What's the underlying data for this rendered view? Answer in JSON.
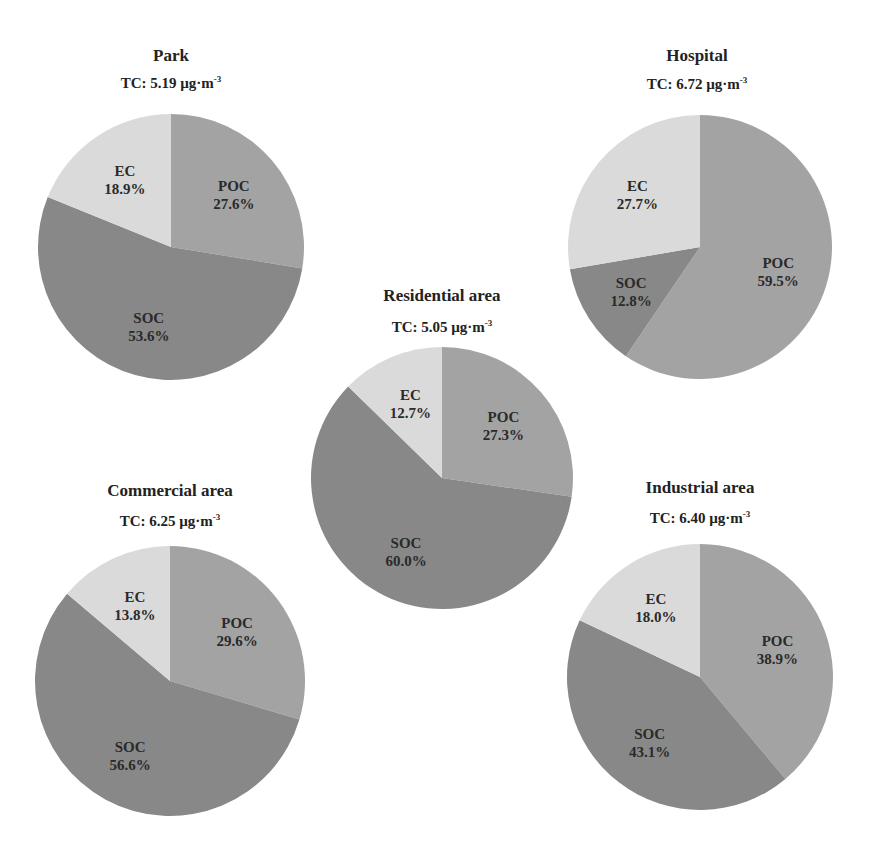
{
  "colors": {
    "POC": "#a3a3a3",
    "SOC": "#888888",
    "EC": "#dadada"
  },
  "chart_data": [
    {
      "type": "pie",
      "title": "Park",
      "subtitle": "TC: 5.19 µg·m-3",
      "tc_value": "TC: 5.19 µg·m",
      "tc_unit_exp": "-3",
      "categories": [
        "POC",
        "SOC",
        "EC"
      ],
      "values": [
        27.6,
        53.6,
        18.9
      ],
      "labels": [
        "27.6%",
        "53.6%",
        "18.9%"
      ],
      "center": [
        171,
        247
      ],
      "radius": 133,
      "title_pos": [
        171,
        46
      ],
      "tc_pos": [
        171,
        74
      ]
    },
    {
      "type": "pie",
      "title": "Hospital",
      "subtitle": "TC: 6.72 µg·m-3",
      "tc_value": "TC: 6.72 µg·m",
      "tc_unit_exp": "-3",
      "categories": [
        "POC",
        "SOC",
        "EC"
      ],
      "values": [
        59.5,
        12.8,
        27.7
      ],
      "labels": [
        "59.5%",
        "12.8%",
        "27.7%"
      ],
      "center": [
        700,
        247
      ],
      "radius": 132,
      "title_pos": [
        697,
        46
      ],
      "tc_pos": [
        697,
        75
      ]
    },
    {
      "type": "pie",
      "title": "Residential area",
      "subtitle": "TC: 5.05 µg·m-3",
      "tc_value": "TC: 5.05 µg·m",
      "tc_unit_exp": "-3",
      "categories": [
        "POC",
        "SOC",
        "EC"
      ],
      "values": [
        27.3,
        60.0,
        12.7
      ],
      "labels": [
        "27.3%",
        "60.0%",
        "12.7%"
      ],
      "center": [
        442,
        478
      ],
      "radius": 131,
      "title_pos": [
        442,
        286
      ],
      "tc_pos": [
        442,
        318
      ]
    },
    {
      "type": "pie",
      "title": "Commercial area",
      "subtitle": "TC: 6.25 µg·m-3",
      "tc_value": "TC: 6.25 µg·m",
      "tc_unit_exp": "-3",
      "categories": [
        "POC",
        "SOC",
        "EC"
      ],
      "values": [
        29.6,
        56.6,
        13.8
      ],
      "labels": [
        "29.6%",
        "56.6%",
        "13.8%"
      ],
      "center": [
        170,
        681
      ],
      "radius": 135,
      "title_pos": [
        170,
        481
      ],
      "tc_pos": [
        170,
        512
      ]
    },
    {
      "type": "pie",
      "title": "Industrial area",
      "subtitle": "TC: 6.40 µg·m-3",
      "tc_value": "TC: 6.40 µg·m",
      "tc_unit_exp": "-3",
      "categories": [
        "POC",
        "SOC",
        "EC"
      ],
      "values": [
        38.9,
        43.1,
        18.0
      ],
      "labels": [
        "38.9%",
        "43.1%",
        "18.0%"
      ],
      "center": [
        700,
        677
      ],
      "radius": 133,
      "title_pos": [
        700,
        478
      ],
      "tc_pos": [
        700,
        509
      ]
    }
  ]
}
